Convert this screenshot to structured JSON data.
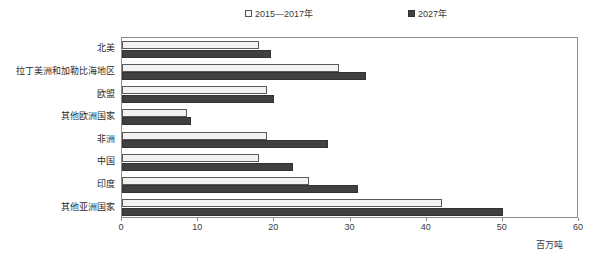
{
  "chart_data": {
    "type": "bar",
    "orientation": "horizontal",
    "title": "",
    "xlabel": "百万吨",
    "ylabel": "",
    "xlim": [
      0,
      60
    ],
    "xticks": [
      0,
      10,
      20,
      30,
      40,
      50,
      60
    ],
    "grid": false,
    "legend_position": "top",
    "categories": [
      "北美",
      "拉丁美洲和加勒比海地区",
      "欧盟",
      "其他欧洲国家",
      "非洲",
      "中国",
      "印度",
      "其他亚洲国家"
    ],
    "series": [
      {
        "name": "2015—2017年",
        "color": "#f2f2f2",
        "border_color": "#5a5a5a",
        "values": [
          18,
          28.5,
          19,
          8.5,
          19,
          18,
          24.5,
          42
        ]
      },
      {
        "name": "2027年",
        "color": "#404040",
        "border_color": "#333333",
        "values": [
          19.5,
          32,
          20,
          9,
          27,
          22.5,
          31,
          50
        ]
      }
    ]
  },
  "legend": {
    "entries": [
      {
        "label": "2015—2017年",
        "swatch": "light"
      },
      {
        "label": "2027年",
        "swatch": "dark"
      }
    ]
  },
  "axis": {
    "unit_label": "百万吨",
    "tick_labels": [
      "0",
      "10",
      "20",
      "30",
      "40",
      "50",
      "60"
    ]
  }
}
